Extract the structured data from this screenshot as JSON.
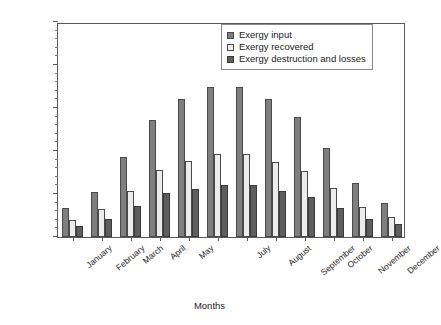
{
  "chart_data": {
    "type": "bar",
    "title": "",
    "xlabel": "Months",
    "ylabel": "Exergy (MJ)",
    "ylim": [
      0,
      2500
    ],
    "ytick_step": 500,
    "yminor_step": 100,
    "grid": false,
    "legend_position": "top-right",
    "categories": [
      "January",
      "February",
      "March",
      "April",
      "May",
      "June",
      "July",
      "August",
      "September",
      "October",
      "November",
      "December"
    ],
    "tick_labels": [
      "January",
      "February",
      "March",
      "April",
      "May",
      "",
      "July",
      "August",
      "September",
      "October",
      "November",
      "December"
    ],
    "ytick_labels": [
      "0",
      "500",
      "1000",
      "1500",
      "2000",
      "2500"
    ],
    "series": [
      {
        "name": "Exergy input",
        "color": "#7f7f7f",
        "values": [
          340,
          520,
          930,
          1360,
          1600,
          1750,
          1750,
          1600,
          1400,
          1040,
          630,
          400
        ]
      },
      {
        "name": "Exergy recovered",
        "color": "#ececec",
        "values": [
          200,
          320,
          540,
          780,
          880,
          960,
          960,
          870,
          770,
          570,
          350,
          230
        ]
      },
      {
        "name": "Exergy destruction and losses",
        "color": "#5e5e5e",
        "values": [
          130,
          205,
          360,
          510,
          560,
          600,
          600,
          530,
          470,
          340,
          215,
          150
        ]
      }
    ]
  }
}
